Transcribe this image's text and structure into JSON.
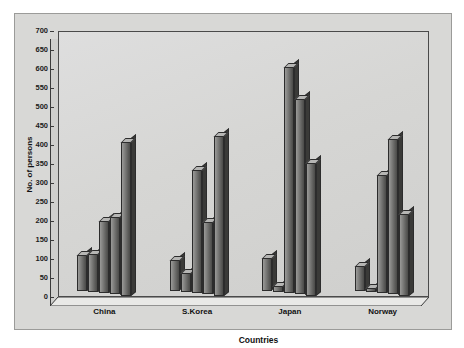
{
  "chart_data": {
    "type": "bar",
    "title": "",
    "xlabel": "Countries",
    "ylabel": "No. of persons",
    "categories": [
      "China",
      "S.Korea",
      "Japan",
      "Norway"
    ],
    "ylim": [
      0,
      700
    ],
    "ytick_step": 50,
    "yticks": [
      0,
      50,
      100,
      150,
      200,
      250,
      300,
      350,
      400,
      450,
      500,
      550,
      600,
      650,
      700
    ],
    "grid": false,
    "legend": "none",
    "style": "3d-clustered-column-grayscale",
    "series": [
      {
        "name": "Series 1",
        "values": [
          95,
          80,
          85,
          65
        ]
      },
      {
        "name": "Series 2",
        "values": [
          100,
          50,
          15,
          10
        ]
      },
      {
        "name": "Series 3",
        "values": [
          190,
          325,
          595,
          310
        ]
      },
      {
        "name": "Series 4",
        "values": [
          205,
          190,
          515,
          410
        ]
      },
      {
        "name": "Series 5",
        "values": [
          405,
          420,
          350,
          215
        ]
      }
    ]
  },
  "colors": {
    "panel_background": "#d8d8d6",
    "plot_background": "#d6d6d4",
    "bar_face": "#7e7e7c",
    "bar_top": "#b6b6b4",
    "bar_side": "#3a3a38",
    "axis": "#3a3a3a",
    "text": "#111111"
  }
}
